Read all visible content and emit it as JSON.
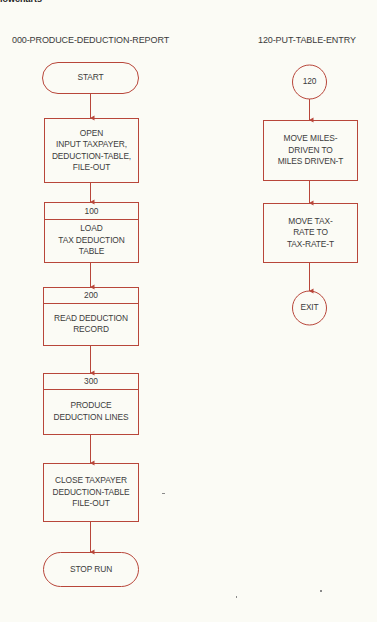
{
  "page": {
    "corner_heading": "lowcharts",
    "line_color": "#b8463a"
  },
  "left_flowchart": {
    "title": "000-PRODUCE-DEDUCTION-REPORT",
    "start": "START",
    "open": "OPEN\nINPUT TAXPAYER,\nDEDUCTION-TABLE,\nFILE-OUT",
    "p100": {
      "id": "100",
      "text": "LOAD\nTAX DEDUCTION\nTABLE"
    },
    "p200": {
      "id": "200",
      "text": "READ DEDUCTION\nRECORD"
    },
    "p300": {
      "id": "300",
      "text": "PRODUCE\nDEDUCTION LINES"
    },
    "close": "CLOSE TAXPAYER\nDEDUCTION-TABLE\nFILE-OUT",
    "stop": "STOP RUN"
  },
  "right_flowchart": {
    "title": "120-PUT-TABLE-ENTRY",
    "entry": "120",
    "move_miles": "MOVE MILES-\nDRIVEN TO\nMILES DRIVEN-T",
    "move_tax": "MOVE TAX-\nRATE TO\nTAX-RATE-T",
    "exit": "EXIT"
  }
}
